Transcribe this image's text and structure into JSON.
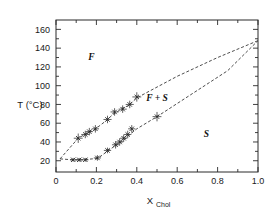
{
  "chart_data": {
    "type": "line",
    "title": "",
    "xlabel": "X_Chol",
    "xlabel_main": "X",
    "xlabel_sub": "Chol",
    "ylabel": "T (°C)",
    "xlim": [
      0.0,
      1.0
    ],
    "ylim": [
      8,
      170
    ],
    "grid": false,
    "legend_position": "none",
    "xticks": [
      0,
      0.2,
      0.4,
      0.6,
      0.8,
      1.0
    ],
    "xtick_labels": [
      "0",
      "0.2",
      "0.4",
      "0.6",
      "0.8",
      "1.0"
    ],
    "xticks_minor": [
      0.1,
      0.3,
      0.5,
      0.7,
      0.9
    ],
    "yticks": [
      20,
      40,
      60,
      80,
      100,
      120,
      140,
      160
    ],
    "ytick_labels": [
      "20",
      "40",
      "60",
      "80",
      "100",
      "120",
      "140",
      "160"
    ],
    "yticks_minor": [
      30,
      50,
      70,
      90,
      110,
      130,
      150
    ],
    "annotations": [
      {
        "text": "F",
        "x": 0.175,
        "y": 127
      },
      {
        "text": "F + S",
        "x": 0.5,
        "y": 84
      },
      {
        "text": "S",
        "x": 0.745,
        "y": 45
      }
    ],
    "series": [
      {
        "name": "liquidus",
        "style": "dashed",
        "x": [
          0.02,
          0.11,
          0.15,
          0.19,
          0.25,
          0.28,
          0.33,
          0.36,
          0.4,
          0.6,
          0.8,
          1.0
        ],
        "y": [
          22,
          44,
          49,
          53,
          63,
          69,
          76,
          79,
          87,
          110,
          130,
          148
        ]
      },
      {
        "name": "solidus",
        "style": "dashed",
        "x": [
          0.02,
          0.08,
          0.13,
          0.18,
          0.21,
          0.26,
          0.3,
          0.33,
          0.36,
          0.4,
          0.5,
          0.7,
          0.85,
          1.0
        ],
        "y": [
          22,
          21,
          21,
          22,
          23,
          31,
          37,
          41,
          47,
          54,
          67,
          95,
          116,
          148
        ]
      }
    ],
    "data_points": [
      {
        "curve": "liquidus",
        "x": 0.11,
        "y": 44,
        "xerr": 0.022,
        "yerr": 5
      },
      {
        "curve": "liquidus",
        "x": 0.145,
        "y": 48,
        "xerr": 0.02,
        "yerr": 4
      },
      {
        "curve": "liquidus",
        "x": 0.165,
        "y": 51,
        "xerr": 0.018,
        "yerr": 4
      },
      {
        "curve": "liquidus",
        "x": 0.195,
        "y": 54,
        "xerr": 0.018,
        "yerr": 4
      },
      {
        "curve": "liquidus",
        "x": 0.255,
        "y": 64,
        "xerr": 0.02,
        "yerr": 4
      },
      {
        "curve": "liquidus",
        "x": 0.29,
        "y": 72,
        "xerr": 0.02,
        "yerr": 4
      },
      {
        "curve": "liquidus",
        "x": 0.33,
        "y": 75,
        "xerr": 0.02,
        "yerr": 4
      },
      {
        "curve": "liquidus",
        "x": 0.365,
        "y": 80,
        "xerr": 0.02,
        "yerr": 4
      },
      {
        "curve": "liquidus",
        "x": 0.4,
        "y": 88,
        "xerr": 0.022,
        "yerr": 5
      },
      {
        "curve": "solidus",
        "x": 0.085,
        "y": 21,
        "xerr": 0.016,
        "yerr": 2
      },
      {
        "curve": "solidus",
        "x": 0.115,
        "y": 21,
        "xerr": 0.016,
        "yerr": 2
      },
      {
        "curve": "solidus",
        "x": 0.145,
        "y": 21,
        "xerr": 0.016,
        "yerr": 2
      },
      {
        "curve": "solidus",
        "x": 0.205,
        "y": 23,
        "xerr": 0.018,
        "yerr": 3
      },
      {
        "curve": "solidus",
        "x": 0.255,
        "y": 31,
        "xerr": 0.018,
        "yerr": 3
      },
      {
        "curve": "solidus",
        "x": 0.295,
        "y": 37,
        "xerr": 0.018,
        "yerr": 4
      },
      {
        "curve": "solidus",
        "x": 0.315,
        "y": 40,
        "xerr": 0.018,
        "yerr": 4
      },
      {
        "curve": "solidus",
        "x": 0.335,
        "y": 44,
        "xerr": 0.018,
        "yerr": 4
      },
      {
        "curve": "solidus",
        "x": 0.355,
        "y": 48,
        "xerr": 0.018,
        "yerr": 4
      },
      {
        "curve": "solidus",
        "x": 0.375,
        "y": 54,
        "xerr": 0.018,
        "yerr": 4
      },
      {
        "curve": "solidus",
        "x": 0.5,
        "y": 67,
        "xerr": 0.022,
        "yerr": 5
      }
    ],
    "colors": {
      "axis": "#2b2b2b",
      "curve": "#3a3a3a",
      "marker": "#222222",
      "background": "#ffffff",
      "text": "#1a1a1a"
    }
  }
}
